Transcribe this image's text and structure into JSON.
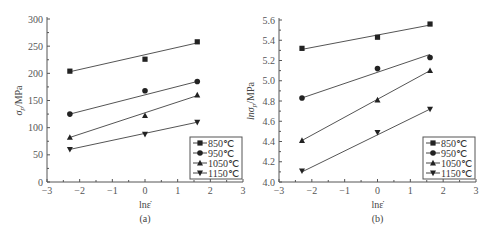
{
  "chart_data": [
    {
      "type": "scatter",
      "panel_label": "(a)",
      "xlabel": "lnε̇",
      "ylabel": "σp/MPa",
      "xlim": [
        -3,
        3
      ],
      "ylim": [
        0,
        300
      ],
      "xticks": [
        -3,
        -2,
        -1,
        0,
        1,
        2,
        3
      ],
      "yticks": [
        0,
        50,
        100,
        150,
        200,
        250,
        300
      ],
      "grid": false,
      "legend_position": "lower right",
      "x": [
        -2.3,
        0,
        1.6
      ],
      "series": [
        {
          "name": "850℃",
          "marker": "square",
          "values": [
            204,
            226,
            258
          ],
          "fit": [
            203,
            256
          ]
        },
        {
          "name": "950℃",
          "marker": "circle",
          "values": [
            125,
            168,
            185
          ],
          "fit": [
            125,
            185
          ]
        },
        {
          "name": "1050℃",
          "marker": "triangle-up",
          "values": [
            82,
            122,
            160
          ],
          "fit": [
            82,
            159
          ]
        },
        {
          "name": "1150℃",
          "marker": "triangle-down",
          "values": [
            60,
            88,
            110
          ],
          "fit": [
            60,
            110
          ]
        }
      ]
    },
    {
      "type": "scatter",
      "panel_label": "(b)",
      "xlabel": "lnε̇",
      "ylabel": "lnσp/MPa",
      "xlim": [
        -3,
        3
      ],
      "ylim": [
        4.0,
        5.6
      ],
      "xticks": [
        -3,
        -2,
        -1,
        0,
        1,
        2,
        3
      ],
      "yticks": [
        4.0,
        4.2,
        4.4,
        4.6,
        4.8,
        5.0,
        5.2,
        5.4,
        5.6
      ],
      "grid": false,
      "legend_position": "lower right",
      "x": [
        -2.3,
        0,
        1.6
      ],
      "series": [
        {
          "name": "850℃",
          "marker": "square",
          "values": [
            5.32,
            5.43,
            5.56
          ],
          "fit": [
            5.31,
            5.55
          ]
        },
        {
          "name": "950℃",
          "marker": "circle",
          "values": [
            4.83,
            5.12,
            5.23
          ],
          "fit": [
            4.83,
            5.26
          ]
        },
        {
          "name": "1050℃",
          "marker": "triangle-up",
          "values": [
            4.41,
            4.81,
            5.1
          ],
          "fit": [
            4.41,
            5.1
          ]
        },
        {
          "name": "1150℃",
          "marker": "triangle-down",
          "values": [
            4.11,
            4.49,
            4.72
          ],
          "fit": [
            4.1,
            4.72
          ]
        }
      ]
    }
  ],
  "labels": {
    "a": {
      "xlabel": "lnε̇",
      "panel": "(a)",
      "ylabel_main": "σ",
      "ylabel_sub": "p",
      "ylabel_unit": "/MPa"
    },
    "b": {
      "xlabel": "lnε̇",
      "panel": "(b)",
      "ylabel_main": "lnσ",
      "ylabel_sub": "p",
      "ylabel_unit": "/MPa"
    }
  },
  "legend": [
    "850℃",
    "950℃",
    "1050℃",
    "1150℃"
  ]
}
